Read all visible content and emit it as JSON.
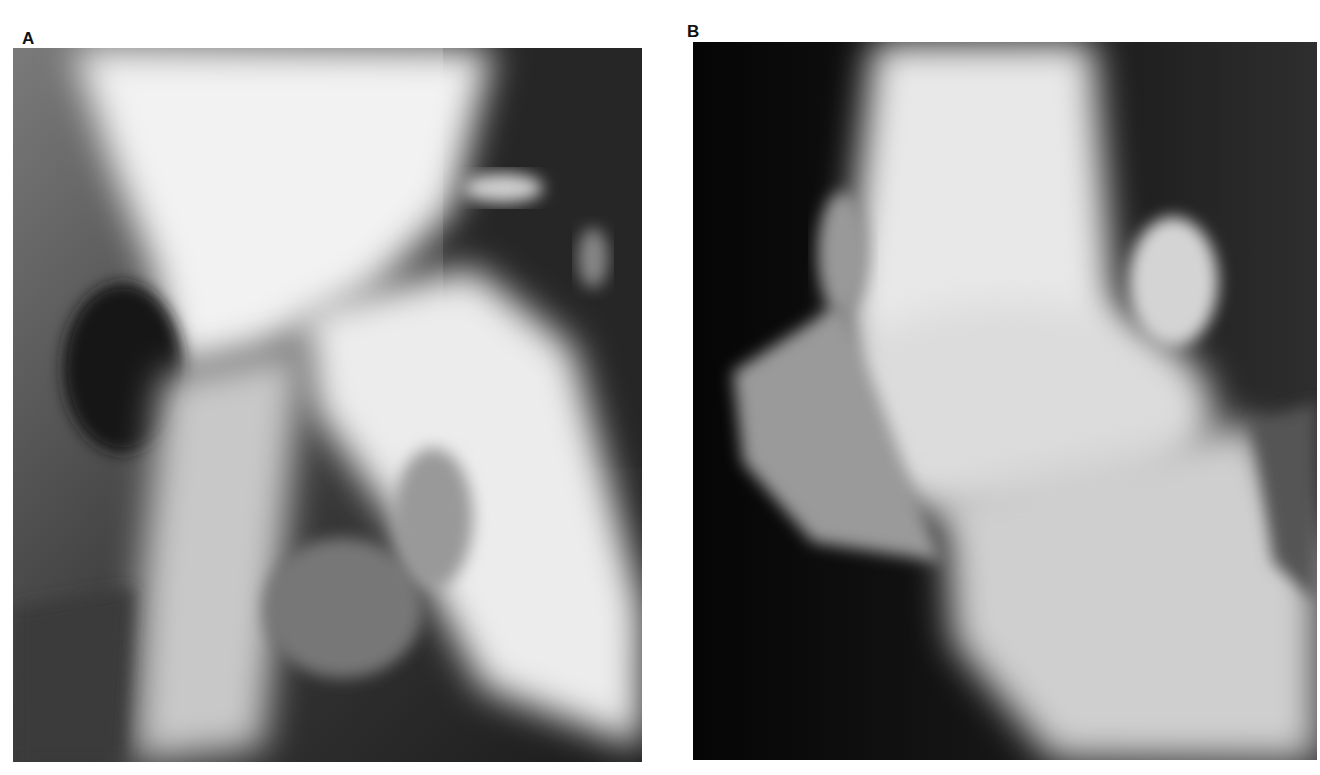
{
  "figure": {
    "panels": [
      {
        "label": "A",
        "description": "Radiograph of hip joint region"
      },
      {
        "label": "B",
        "description": "Lateral radiograph of knee/ankle joint region"
      }
    ]
  }
}
